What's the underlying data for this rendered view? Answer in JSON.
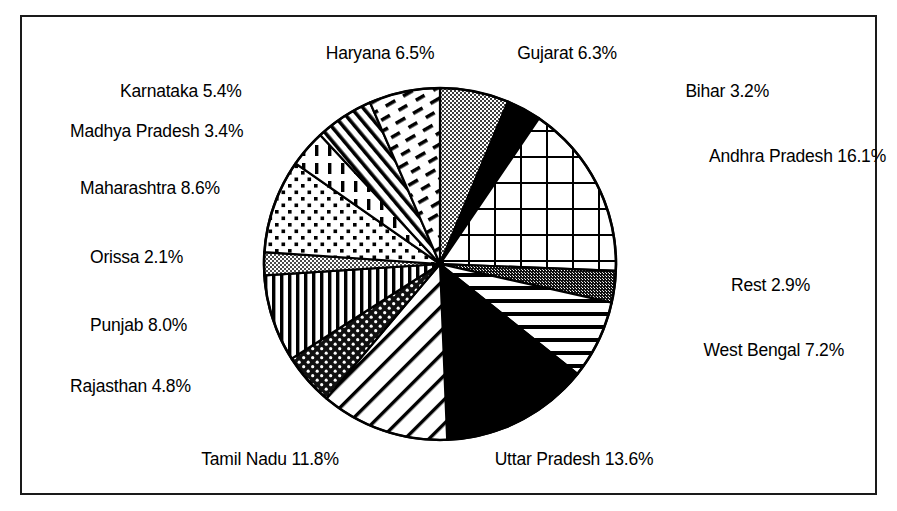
{
  "figure": {
    "border_color": "#1a1a1a",
    "background": "#ffffff"
  },
  "chart_data": {
    "type": "pie",
    "title": "",
    "subtitle": "",
    "xlabel": "",
    "ylabel": "",
    "legend_position": "around-slices",
    "grid": false,
    "start_angle_deg": 0,
    "direction": "clockwise",
    "center": {
      "x": 440,
      "y": 264,
      "radius": 176
    },
    "units": "percent",
    "categories": [
      "Gujarat",
      "Bihar",
      "Andhra Pradesh",
      "Rest",
      "West Bengal",
      "Uttar Pradesh",
      "Tamil Nadu",
      "Rajasthan",
      "Punjab",
      "Orissa",
      "Maharashtra",
      "Madhya Pradesh",
      "Karnataka",
      "Haryana"
    ],
    "values": [
      6.3,
      3.2,
      16.1,
      2.9,
      7.2,
      13.6,
      11.8,
      4.8,
      8.0,
      2.1,
      8.6,
      3.4,
      5.4,
      6.5
    ],
    "slices": [
      {
        "name": "Gujarat",
        "value": 6.3,
        "label": "Gujarat 6.3%",
        "pattern": "gray-stipple",
        "fill": "#9a9a9a"
      },
      {
        "name": "Bihar",
        "value": 3.2,
        "label": "Bihar 3.2%",
        "pattern": "solid-black",
        "fill": "#000000"
      },
      {
        "name": "Andhra Pradesh",
        "value": 16.1,
        "label": "Andhra Pradesh 16.1%",
        "pattern": "grid",
        "fill": "#ffffff"
      },
      {
        "name": "Rest",
        "value": 2.9,
        "label": "Rest 2.9%",
        "pattern": "dark-stipple",
        "fill": "#3a3a3a"
      },
      {
        "name": "West Bengal",
        "value": 7.2,
        "label": "West Bengal 7.2%",
        "pattern": "horizontal-lines",
        "fill": "#ffffff"
      },
      {
        "name": "Uttar Pradesh",
        "value": 13.6,
        "label": "Uttar Pradesh 13.6%",
        "pattern": "solid-black",
        "fill": "#000000"
      },
      {
        "name": "Tamil Nadu",
        "value": 11.8,
        "label": "Tamil Nadu 11.8%",
        "pattern": "diagonal-lines",
        "fill": "#ffffff"
      },
      {
        "name": "Rajasthan",
        "value": 4.8,
        "label": "Rajasthan 4.8%",
        "pattern": "black-dots-fill",
        "fill": "#1a1a1a"
      },
      {
        "name": "Punjab",
        "value": 8.0,
        "label": "Punjab 8.0%",
        "pattern": "vertical-lines",
        "fill": "#ffffff"
      },
      {
        "name": "Orissa",
        "value": 2.1,
        "label": "Orissa 2.1%",
        "pattern": "gray-checker",
        "fill": "#8c8c8c"
      },
      {
        "name": "Maharashtra",
        "value": 8.6,
        "label": "Maharashtra 8.6%",
        "pattern": "small-dots",
        "fill": "#ffffff"
      },
      {
        "name": "Madhya Pradesh",
        "value": 3.4,
        "label": "Madhya Pradesh 3.4%",
        "pattern": "dashed-vertical",
        "fill": "#ffffff"
      },
      {
        "name": "Karnataka",
        "value": 5.4,
        "label": "Karnataka 5.4%",
        "pattern": "dense-diagonal",
        "fill": "#ffffff"
      },
      {
        "name": "Haryana",
        "value": 6.5,
        "label": "Haryana 6.5%",
        "pattern": "dashes",
        "fill": "#ffffff"
      }
    ]
  },
  "labels": {
    "haryana": "Haryana 6.5%",
    "gujarat": "Gujarat 6.3%",
    "karnataka": "Karnataka 5.4%",
    "bihar": "Bihar 3.2%",
    "madhya_pradesh": "Madhya Pradesh 3.4%",
    "andhra_pradesh": "Andhra Pradesh 16.1%",
    "maharashtra": "Maharashtra 8.6%",
    "orissa": "Orissa 2.1%",
    "rest": "Rest 2.9%",
    "punjab": "Punjab 8.0%",
    "west_bengal": "West Bengal 7.2%",
    "rajasthan": "Rajasthan 4.8%",
    "tamil_nadu": "Tamil Nadu 11.8%",
    "uttar_pradesh": "Uttar Pradesh 13.6%"
  }
}
